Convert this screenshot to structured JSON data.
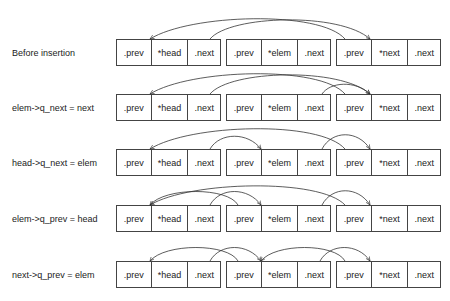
{
  "diagram": {
    "node_fields": [
      ".prev",
      "*{name}",
      ".next"
    ],
    "nodes": [
      {
        "name": "head",
        "fields": [
          ".prev",
          "*head",
          ".next"
        ]
      },
      {
        "name": "elem",
        "fields": [
          ".prev",
          "*elem",
          ".next"
        ]
      },
      {
        "name": "next",
        "fields": [
          ".prev",
          "*next",
          ".next"
        ]
      }
    ],
    "rows": [
      {
        "label": "Before insertion",
        "links": [
          {
            "from": "head.next",
            "to": "next"
          },
          {
            "from": "next.prev",
            "to": "head"
          }
        ]
      },
      {
        "label": "elem->q_next = next",
        "links": [
          {
            "from": "head.next",
            "to": "next"
          },
          {
            "from": "next.prev",
            "to": "head"
          },
          {
            "from": "elem.next",
            "to": "next"
          }
        ]
      },
      {
        "label": "head->q_next = elem",
        "links": [
          {
            "from": "head.next",
            "to": "elem"
          },
          {
            "from": "next.prev",
            "to": "head"
          },
          {
            "from": "elem.next",
            "to": "next"
          }
        ]
      },
      {
        "label": "elem->q_prev = head",
        "links": [
          {
            "from": "head.next",
            "to": "elem"
          },
          {
            "from": "elem.prev",
            "to": "head"
          },
          {
            "from": "next.prev",
            "to": "head"
          },
          {
            "from": "elem.next",
            "to": "next"
          }
        ]
      },
      {
        "label": "next->q_prev = elem",
        "links": [
          {
            "from": "head.next",
            "to": "elem"
          },
          {
            "from": "elem.prev",
            "to": "head"
          },
          {
            "from": "elem.next",
            "to": "next"
          },
          {
            "from": "next.prev",
            "to": "elem"
          }
        ]
      }
    ]
  }
}
